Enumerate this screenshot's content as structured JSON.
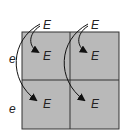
{
  "diagram": {
    "type": "punnett-square-allele-arrows",
    "grid": {
      "rows": 2,
      "cols": 2,
      "fill": "#b9b9b9",
      "stroke": "#333333"
    },
    "column_headers": [
      "E",
      "E"
    ],
    "row_headers": [
      "e",
      "e"
    ],
    "cells": [
      [
        "E",
        "E"
      ],
      [
        "E",
        "E"
      ]
    ],
    "arrows": [
      {
        "from": "column_header_1",
        "to": "cell_r1_c1"
      },
      {
        "from": "column_header_1",
        "to": "cell_r2_c1"
      },
      {
        "from": "column_header_2",
        "to": "cell_r1_c2"
      },
      {
        "from": "column_header_2",
        "to": "cell_r2_c2"
      }
    ]
  }
}
